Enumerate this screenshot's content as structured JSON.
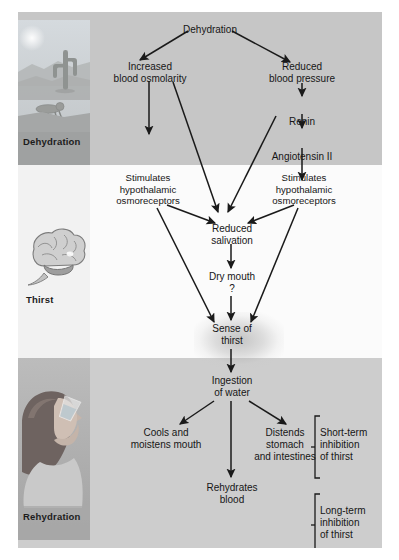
{
  "figure": {
    "bands": [
      {
        "id": "dehydration",
        "label": "Dehydration",
        "icon": "desert-cactus-crawling-person-icon",
        "color": "#c6c6c6"
      },
      {
        "id": "thirst",
        "label": "Thirst",
        "icon": "brain-icon",
        "color": "#fbfbfb"
      },
      {
        "id": "rehydration",
        "label": "Rehydration",
        "icon": "woman-drinking-water-icon",
        "color": "#cdcdcd"
      }
    ]
  },
  "nodes": {
    "dehydration": "Dehydration",
    "increased_osmolarity": "Increased\nblood osmolarity",
    "reduced_bp": "Reduced\nblood pressure",
    "renin": "Renin",
    "angiotensin": "Angiotensin II",
    "stim_left": "Stimulates\nhypothalamic\nosmoreceptors",
    "stim_right": "Stimulates\nhypothalamic\nosmoreceptors",
    "reduced_salivation": "Reduced\nsalivation",
    "dry_mouth": "Dry mouth",
    "dry_mouth_q": "?",
    "sense_of_thirst": "Sense of\nthirst",
    "ingestion": "Ingestion\nof water",
    "cools": "Cools and\nmoistens mouth",
    "distends": "Distends\nstomach\nand intestines",
    "rehydrates": "Rehydrates\nblood",
    "short_term": "Short-term\ninhibition\nof thirst",
    "long_term": "Long-term\ninhibition\nof thirst"
  },
  "colors": {
    "band_dehydration": "#c6c6c6",
    "band_thirst": "#fbfbfb",
    "band_rehydration": "#cdcdcd",
    "arrow": "#1a1a1a",
    "text": "#161616"
  }
}
